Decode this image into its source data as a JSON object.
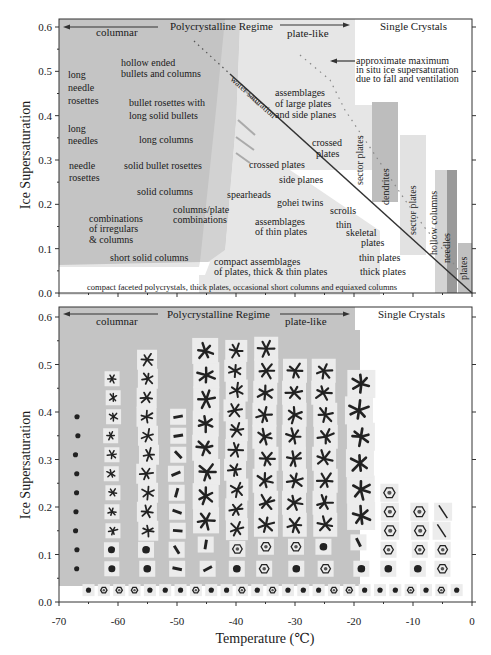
{
  "figure": {
    "y_axis_label": "Ice Supersaturation",
    "x_axis_label": "Temperature (℃)",
    "x_ticks": [
      "-70",
      "-60",
      "-50",
      "-40",
      "-30",
      "-20",
      "-10",
      "0"
    ],
    "y_ticks": [
      "0.0",
      "0.1",
      "0.2",
      "0.3",
      "0.4",
      "0.5",
      "0.6"
    ],
    "x_range": [
      -70,
      0
    ],
    "y_range": [
      0.0,
      0.6
    ]
  },
  "top_panel": {
    "header": {
      "columnar": "columnar",
      "regime": "Polycrystalline Regime",
      "plate_like": "plate-like",
      "single": "Single Crystals"
    },
    "water_saturation": "water saturation",
    "max_note": [
      "approximate maximum",
      "in situ ice supersaturation",
      "due to fall and ventilation"
    ],
    "labels": [
      {
        "id": "long-needle-rosettes",
        "lines": [
          "long",
          "needle",
          "rosettes"
        ]
      },
      {
        "id": "hollow-ended",
        "lines": [
          "hollow ended",
          "bullets and columns"
        ]
      },
      {
        "id": "bullet-rosettes",
        "lines": [
          "bullet rosettes with",
          "long solid bullets"
        ]
      },
      {
        "id": "long-needles",
        "lines": [
          "long",
          "needles"
        ]
      },
      {
        "id": "long-columns",
        "lines": [
          "long columns"
        ]
      },
      {
        "id": "needle-rosettes",
        "lines": [
          "needle",
          "rosettes"
        ]
      },
      {
        "id": "solid-bullet-rosettes",
        "lines": [
          "solid bullet rosettes"
        ]
      },
      {
        "id": "solid-columns",
        "lines": [
          "solid columns"
        ]
      },
      {
        "id": "columns-plate",
        "lines": [
          "columns/plate",
          "combinations"
        ]
      },
      {
        "id": "combinations-irregulars",
        "lines": [
          "combinations",
          "of irregulars",
          "& columns"
        ]
      },
      {
        "id": "short-solid-columns",
        "lines": [
          "short solid columns"
        ]
      },
      {
        "id": "assemblages-large",
        "lines": [
          "assemblages",
          "of large plates",
          "and side planes"
        ]
      },
      {
        "id": "crossed-plates-upper",
        "lines": [
          "crossed",
          "plates"
        ]
      },
      {
        "id": "crossed-plates",
        "lines": [
          "crossed plates"
        ]
      },
      {
        "id": "side-planes",
        "lines": [
          "side planes"
        ]
      },
      {
        "id": "spearheads",
        "lines": [
          "spearheads"
        ]
      },
      {
        "id": "gohei-twins",
        "lines": [
          "gohei twins"
        ]
      },
      {
        "id": "scrolls",
        "lines": [
          "scrolls"
        ]
      },
      {
        "id": "assemblages-thin",
        "lines": [
          "assemblages",
          "of thin plates"
        ]
      },
      {
        "id": "thin",
        "lines": [
          "thin"
        ]
      },
      {
        "id": "skeletal",
        "lines": [
          "skeletal",
          "plates"
        ]
      },
      {
        "id": "thin-plates",
        "lines": [
          "thin plates"
        ]
      },
      {
        "id": "thick-plates",
        "lines": [
          "thick plates"
        ]
      },
      {
        "id": "compact-assemblages",
        "lines": [
          "compact assemblages",
          "of plates, thick & thin plates"
        ]
      },
      {
        "id": "bottom-band",
        "lines": [
          "compact faceted polycrystals, thick plates, occasional short columns and equiaxed columns"
        ]
      }
    ],
    "vertical_labels": {
      "sector_plates_1": "sector plates",
      "dendrites": "dendrites",
      "sector_plates_2": "sector plates",
      "hollow_columns": "hollow columns",
      "needles": "needles",
      "plates": "plates"
    }
  },
  "bottom_panel": {
    "header": {
      "columnar": "columnar",
      "regime": "Polycrystalline Regime",
      "plate_like": "plate-like",
      "single": "Single Crystals"
    },
    "description": "Grid of ice crystal micrograph images arranged by temperature and ice supersaturation"
  }
}
